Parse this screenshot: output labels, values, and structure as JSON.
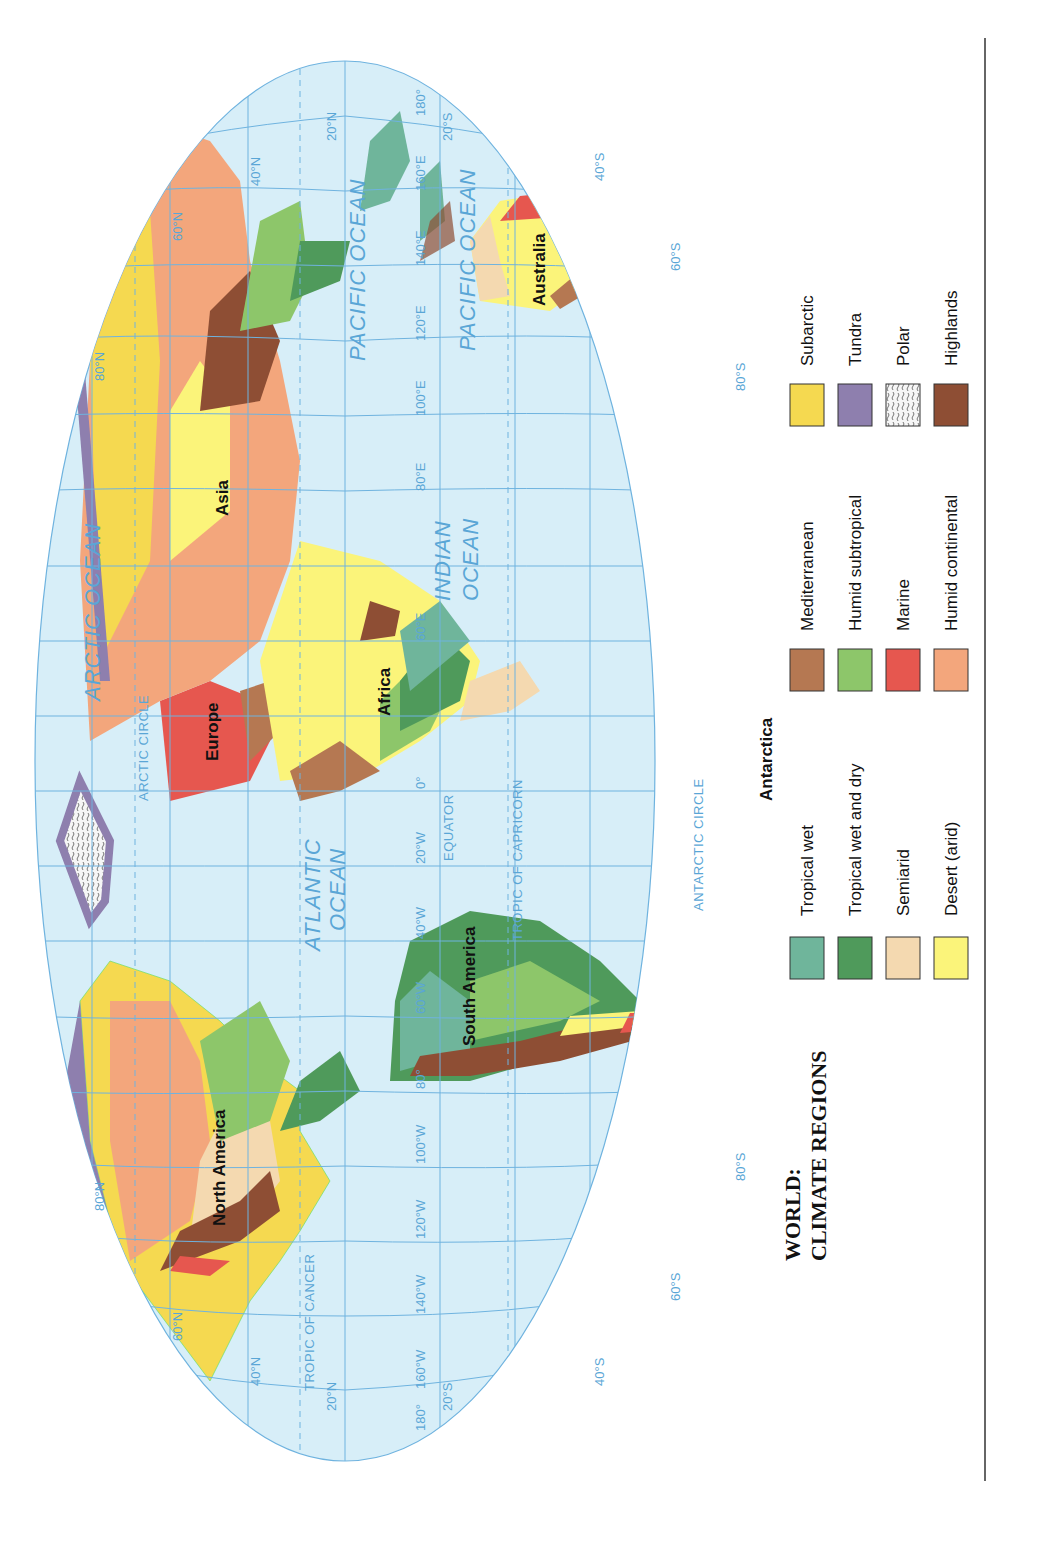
{
  "title": {
    "line1": "WORLD:",
    "line2": "CLIMATE REGIONS"
  },
  "colors": {
    "ocean": "#d7eef8",
    "graticule": "#6fb3df",
    "tropical_wet": "#6fb59b",
    "tropical_wet_and_dry": "#4f9a5b",
    "semiarid": "#f4d9b0",
    "desert": "#fbf47a",
    "mediterranean": "#b57852",
    "humid_subtropical": "#8dc66a",
    "marine": "#e6574f",
    "humid_continental": "#f3a67c",
    "subarctic": "#f5d950",
    "tundra": "#8e7fae",
    "polar": "#f4f4f4",
    "highlands": "#8e4e34"
  },
  "legend": {
    "columns": [
      [
        {
          "label": "Tropical wet",
          "key": "tropical_wet"
        },
        {
          "label": "Tropical wet and dry",
          "key": "tropical_wet_and_dry"
        },
        {
          "label": "Semiarid",
          "key": "semiarid"
        },
        {
          "label": "Desert (arid)",
          "key": "desert"
        }
      ],
      [
        {
          "label": "Mediterranean",
          "key": "mediterranean"
        },
        {
          "label": "Humid subtropical",
          "key": "humid_subtropical"
        },
        {
          "label": "Marine",
          "key": "marine"
        },
        {
          "label": "Humid continental",
          "key": "humid_continental"
        }
      ],
      [
        {
          "label": "Subarctic",
          "key": "subarctic"
        },
        {
          "label": "Tundra",
          "key": "tundra"
        },
        {
          "label": "Polar",
          "key": "polar"
        },
        {
          "label": "Highlands",
          "key": "highlands"
        }
      ]
    ]
  },
  "oceans": [
    {
      "label": "ARCTIC OCEAN",
      "lines": [
        "ARCTIC OCEAN"
      ]
    },
    {
      "label": "PACIFIC OCEAN (west)",
      "lines": [
        "PACIFIC OCEAN"
      ]
    },
    {
      "label": "ATLANTIC OCEAN",
      "lines": [
        "ATLANTIC",
        "OCEAN"
      ]
    },
    {
      "label": "INDIAN OCEAN",
      "lines": [
        "INDIAN",
        "OCEAN"
      ]
    },
    {
      "label": "PACIFIC OCEAN (east)",
      "lines": [
        "PACIFIC OCEAN"
      ]
    }
  ],
  "continents": [
    "North America",
    "South America",
    "Europe",
    "Africa",
    "Asia",
    "Australia",
    "Antarctica"
  ],
  "circles": {
    "arctic": "ARCTIC CIRCLE",
    "tropic_cancer": "TROPIC OF CANCER",
    "equator": "EQUATOR",
    "tropic_capricorn": "TROPIC OF CAPRICORN",
    "antarctic": "ANTARCTIC CIRCLE"
  },
  "graticule": {
    "longitudes_bottom": [
      "180°",
      "160°W",
      "140°W",
      "120°W",
      "100°W",
      "80°",
      "60°W",
      "40°W",
      "20°W",
      "0°",
      "20°E",
      "40°E",
      "60°E",
      "80°E",
      "100°E",
      "120°E",
      "140°E",
      "160°E",
      "180°"
    ],
    "latitudes_left": [
      "80°N",
      "60°N",
      "40°N",
      "20°N",
      "0°",
      "20°S",
      "40°S",
      "60°S",
      "80°S"
    ],
    "latitudes_right": [
      "80°N",
      "60°N",
      "40°N",
      "20°N",
      "0°",
      "20°S",
      "40°S",
      "60°S",
      "80°S"
    ]
  }
}
